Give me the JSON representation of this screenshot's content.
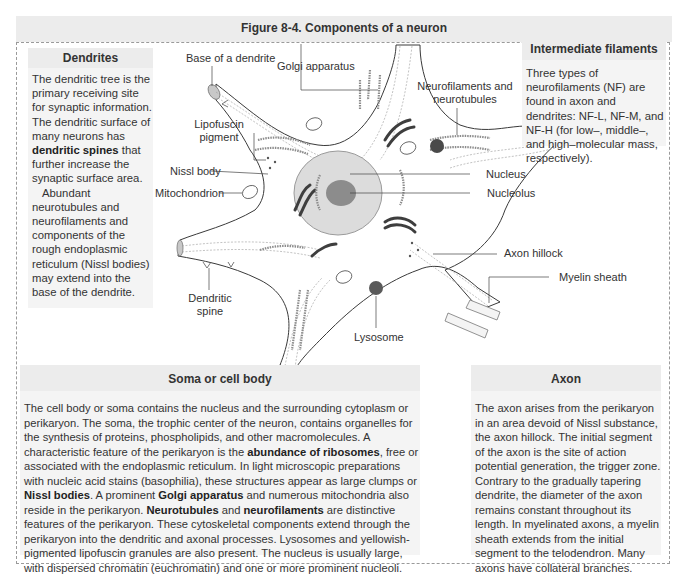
{
  "figure": {
    "title": "Figure 8-4. Components of a neuron"
  },
  "dendrites_box": {
    "heading": "Dendrites",
    "p1_a": "The dendritic tree is the primary receiving site for synaptic information. The dendritic surface of many neurons has ",
    "p1_bold": "dendritic spines",
    "p1_b": " that further increase the synaptic surface area.",
    "p2": "Abundant neurotubules and neurofilaments and components of the rough endoplasmic reticulum (Nissl bodies) may extend into the base of the dendrite."
  },
  "intermediate_box": {
    "heading": "Intermediate filaments",
    "body": "Three types of neurofilaments (NF) are found in axon and dendrites: NF-L, NF-M, and NF-H (for low–, middle–, and high–molecular mass, respectively)."
  },
  "labels": {
    "base_dendrite": "Base of a dendrite",
    "golgi": "Golgi apparatus",
    "neurofilaments_1": "Neurofilaments and",
    "neurofilaments_2": "neurotubules",
    "lipofuscin_1": "Lipofuscin",
    "lipofuscin_2": "pigment",
    "nissl": "Nissl body",
    "mitochondrion": "Mitochondrion",
    "nucleus": "Nucleus",
    "nucleolus": "Nucleolus",
    "axon_hillock": "Axon hillock",
    "myelin": "Myelin sheath",
    "dendritic_spine_1": "Dendritic",
    "dendritic_spine_2": "spine",
    "lysosome": "Lysosome"
  },
  "soma_box": {
    "heading": "Soma or cell body",
    "t1": "The cell body or soma contains the nucleus and the surrounding cytoplasm or perikaryon. The soma, the trophic center of the neuron, contains organelles for the synthesis of proteins, phospholipids, and other macromolecules. A characteristic feature of the perikaryon is the ",
    "b1": "abundance of ribosomes",
    "t2": ", free or associated with the endoplasmic reticulum. In light microscopic preparations with nucleic acid stains (basophilia), these structures appear as large clumps or ",
    "b2": "Nissl bodies",
    "t3": ". A prominent ",
    "b3": "Golgi apparatus",
    "t4": " and numerous mitochondria also reside in the perikaryon. ",
    "b4": "Neurotubules",
    "t5": " and ",
    "b5": "neurofilaments",
    "t6": " are distinctive features of the perikaryon. These cytoskeletal components extend through the perikaryon into the dendritic and axonal processes. Lysosomes and yellowish-pigmented lipofuscin granules are also present. The nucleus is usually large, with dispersed chromatin (euchromatin) and one or more prominent nucleoli."
  },
  "axon_box": {
    "heading": "Axon",
    "body": "The axon arises from the perikaryon in an area devoid of Nissl substance, the axon hillock. The initial segment of the axon is the site of action potential generation, the trigger zone. Contrary to the gradually tapering dendrite, the diameter of the axon remains constant throughout its length. In myelinated axons, a myelin sheath extends from the initial segment to the telodendron. Many axons have collateral branches."
  },
  "colors": {
    "box_bg": "#f4f4f4",
    "head_bg": "#ececec",
    "nucleus": "#d9d9d9",
    "nucleolus": "#8a8a8a",
    "organelle_dark": "#4a4a4a",
    "organelle_mid": "#8c8c8c",
    "lysosome": "#5a5a5a"
  }
}
